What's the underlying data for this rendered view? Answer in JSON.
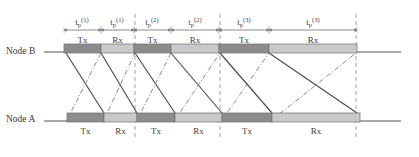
{
  "figure": {
    "type": "timing-diagram",
    "width": 419,
    "height": 157,
    "background_color": "#ffffff"
  },
  "nodes": [
    {
      "id": "node-b",
      "label": "Node B",
      "label_x": 6,
      "label_y": 46,
      "axis_y": 52,
      "leader_from_x": 44,
      "leader_to_x": 64,
      "bar_y": 44,
      "bar_height": 9,
      "bar_start": 64,
      "bar_end": 357,
      "line_end": 401,
      "labels_position": "above"
    },
    {
      "id": "node-a",
      "label": "Node A",
      "label_x": 6,
      "label_y": 114,
      "axis_y": 121,
      "leader_from_x": 44,
      "leader_to_x": 67,
      "bar_y": 113,
      "bar_height": 9,
      "bar_start": 67,
      "bar_end": 360,
      "line_end": 401,
      "labels_position": "below"
    }
  ],
  "colors": {
    "tx_fill": "#8c8c8c",
    "rx_fill": "#c9c9c9",
    "bar_stroke": "#6d6d6d",
    "axis_stroke": "#555555",
    "solid_ray": "#4b4b4b",
    "dashdot_ray": "#8a8a8a",
    "dashed_vertical": "#9a9a9a",
    "dimension_line": "#6f6f6f",
    "text": "#3d3d3d"
  },
  "node_b_segments": [
    {
      "kind": "tx",
      "label": "Tx",
      "x0": 64,
      "x1": 101
    },
    {
      "kind": "rx",
      "label": "Rx",
      "x0": 101,
      "x1": 134
    },
    {
      "kind": "tx",
      "label": "Tx",
      "x0": 134,
      "x1": 171
    },
    {
      "kind": "rx",
      "label": "Rx",
      "x0": 171,
      "x1": 219
    },
    {
      "kind": "tx",
      "label": "Tx",
      "x0": 219,
      "x1": 269
    },
    {
      "kind": "rx",
      "label": "Rx",
      "x0": 269,
      "x1": 357
    }
  ],
  "node_a_segments": [
    {
      "kind": "tx",
      "label": "Tx",
      "x0": 67,
      "x1": 104
    },
    {
      "kind": "rx",
      "label": "Rx",
      "x0": 104,
      "x1": 137
    },
    {
      "kind": "tx",
      "label": "Tx",
      "x0": 137,
      "x1": 175
    },
    {
      "kind": "rx",
      "label": "Rx",
      "x0": 175,
      "x1": 222
    },
    {
      "kind": "tx",
      "label": "Tx",
      "x0": 222,
      "x1": 272
    },
    {
      "kind": "rx",
      "label": "Rx",
      "x0": 272,
      "x1": 360
    }
  ],
  "dimensions": [
    {
      "id": "tp-1a",
      "base": "t",
      "sub": "p",
      "sup": "(1)",
      "x0": 64,
      "x1": 101,
      "center": 82
    },
    {
      "id": "tp-1b",
      "base": "t",
      "sub": "p",
      "sup": "(1)",
      "x0": 101,
      "x1": 134,
      "center": 117
    },
    {
      "id": "tp-2a",
      "base": "t",
      "sub": "p",
      "sup": "(2)",
      "x0": 134,
      "x1": 171,
      "center": 152
    },
    {
      "id": "tp-2b",
      "base": "t",
      "sub": "p",
      "sup": "(2)",
      "x0": 171,
      "x1": 219,
      "center": 195
    },
    {
      "id": "tp-3a",
      "base": "t",
      "sub": "p",
      "sup": "(3)",
      "x0": 219,
      "x1": 269,
      "center": 244
    },
    {
      "id": "tp-3b",
      "base": "t",
      "sub": "p",
      "sup": "(3)",
      "x0": 269,
      "x1": 357,
      "center": 313
    }
  ],
  "dimension_axis_y": 30,
  "dashed_verticals": [
    {
      "x": 135,
      "y0": 14,
      "y1": 140
    },
    {
      "x": 220,
      "y0": 14,
      "y1": 140
    },
    {
      "x": 356,
      "y0": 14,
      "y1": 140
    }
  ],
  "rays": [
    {
      "style": "solid",
      "from_node": "node-b",
      "x0": 66,
      "y0": 53,
      "x1": 104,
      "y1": 113
    },
    {
      "style": "dashdot",
      "from_node": "node-a",
      "x0": 67,
      "y0": 120,
      "x1": 101,
      "y1": 53
    },
    {
      "style": "solid",
      "from_node": "node-b",
      "x0": 101,
      "y0": 53,
      "x1": 137,
      "y1": 113
    },
    {
      "style": "dashdot",
      "from_node": "node-a",
      "x0": 104,
      "y0": 120,
      "x1": 135,
      "y1": 53
    },
    {
      "style": "solid",
      "from_node": "node-b",
      "x0": 135,
      "y0": 53,
      "x1": 175,
      "y1": 113
    },
    {
      "style": "dashdot",
      "from_node": "node-a",
      "x0": 137,
      "y0": 120,
      "x1": 171,
      "y1": 53
    },
    {
      "style": "solid",
      "from_node": "node-b",
      "x0": 171,
      "y0": 53,
      "x1": 222,
      "y1": 113
    },
    {
      "style": "dashdot",
      "from_node": "node-a",
      "x0": 175,
      "y0": 120,
      "x1": 220,
      "y1": 53
    },
    {
      "style": "solid",
      "from_node": "node-b",
      "x0": 220,
      "y0": 53,
      "x1": 272,
      "y1": 113
    },
    {
      "style": "dashdot",
      "from_node": "node-a",
      "x0": 222,
      "y0": 120,
      "x1": 269,
      "y1": 53
    },
    {
      "style": "solid",
      "from_node": "node-b",
      "x0": 269,
      "y0": 53,
      "x1": 357,
      "y1": 113
    },
    {
      "style": "dashdot",
      "from_node": "node-a",
      "x0": 272,
      "y0": 120,
      "x1": 356,
      "y1": 53
    }
  ]
}
